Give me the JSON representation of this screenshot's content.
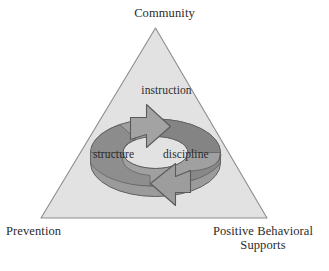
{
  "figure": {
    "type": "cycle-in-triangle-diagram",
    "background_color": "#ffffff",
    "triangle": {
      "name": "framework-triangle",
      "fill_color": "#e2e2e2",
      "stroke_color": "#8d8d8d",
      "vertices": {
        "apex": "Community",
        "bottom_left": "Prevention",
        "bottom_right_line1": "Positive Behavioral",
        "bottom_right_line2": "Supports"
      }
    },
    "cycle": {
      "name": "circular-cycle-arrows",
      "band_color": "#9b9b9b",
      "shadow_color": "#7e7e7e",
      "stroke_color": "#5f5f5f",
      "arrow_count": 2,
      "labels": {
        "top": "instruction",
        "left": "structure",
        "right": "discipline"
      }
    }
  },
  "labels": {
    "community": "Community",
    "prevention": "Prevention",
    "positive_behavioral": "Positive Behavioral",
    "supports": "Supports",
    "instruction": "instruction",
    "structure": "structure",
    "discipline": "discipline"
  }
}
